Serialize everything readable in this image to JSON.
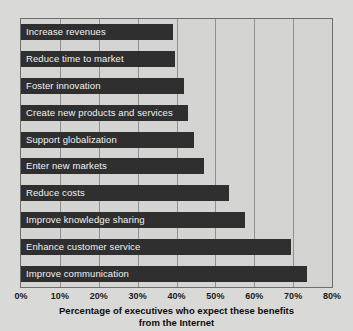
{
  "chart_data": {
    "type": "bar",
    "orientation": "horizontal",
    "title": "",
    "xlabel": "Percentage of executives who expect these benefits from the Internet",
    "ylabel": "",
    "xlim": [
      0,
      80
    ],
    "xticks": [
      "0%",
      "10%",
      "20%",
      "30%",
      "40%",
      "50%",
      "60%",
      "70%",
      "80%"
    ],
    "xtick_values": [
      0,
      10,
      20,
      30,
      40,
      50,
      60,
      70,
      80
    ],
    "grid": true,
    "legend": false,
    "bar_color": "#2f2f2f",
    "plot_background": "#d4d4d2",
    "figure_background": "#d9d9d7",
    "categories": [
      "Increase revenues",
      "Reduce time to market",
      "Foster innovation",
      "Create new products and services",
      "Support globalization",
      "Enter new markets",
      "Reduce costs",
      "Improve knowledge sharing",
      "Enhance customer service",
      "Improve communication"
    ],
    "values": [
      39,
      39.5,
      42,
      43,
      44.5,
      47,
      53.5,
      57.5,
      69.5,
      73.5
    ]
  },
  "caption": {
    "line1": "Percentage of executives who expect these benefits",
    "line2": "from the Internet"
  }
}
